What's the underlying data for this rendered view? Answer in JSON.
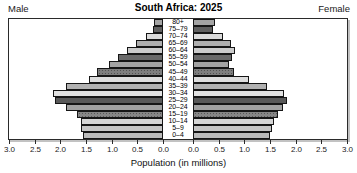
{
  "header": {
    "left_label": "Male",
    "right_label": "Female",
    "title": "South Africa: 2025"
  },
  "axis": {
    "xlabel": "Population (in millions)",
    "left_tick_labels": [
      "3.0",
      "2.5",
      "2.0",
      "1.5",
      "1.0",
      "0.5",
      "0.0"
    ],
    "right_tick_labels": [
      "0.0",
      "0.5",
      "1.0",
      "1.5",
      "2.0",
      "2.5",
      "3.0"
    ]
  },
  "chart_data": {
    "type": "bar",
    "subtype": "population-pyramid",
    "title": "South Africa: 2025",
    "xlabel": "Population (in millions)",
    "unit": "millions of people",
    "axis_range_each_side": [
      0,
      3.0
    ],
    "tick_step": 0.5,
    "grid": false,
    "categories": [
      "80+",
      "75–79",
      "70–74",
      "65–69",
      "60–64",
      "55–59",
      "50–54",
      "45–49",
      "40–44",
      "35–39",
      "30–34",
      "25–29",
      "20–24",
      "15–19",
      "10–14",
      "5–9",
      "0–4"
    ],
    "series": [
      {
        "name": "Male",
        "side": "left",
        "values": [
          0.18,
          0.19,
          0.34,
          0.52,
          0.7,
          0.87,
          1.06,
          1.29,
          1.45,
          1.89,
          2.14,
          2.1,
          1.89,
          1.67,
          1.6,
          1.6,
          1.55
        ]
      },
      {
        "name": "Female",
        "side": "right",
        "values": [
          0.42,
          0.39,
          0.58,
          0.74,
          0.81,
          0.75,
          0.7,
          0.79,
          1.1,
          1.45,
          1.78,
          1.84,
          1.75,
          1.65,
          1.58,
          1.53,
          1.5
        ]
      }
    ],
    "bar_colors": [
      "#a4a4a4",
      "#606060",
      "#dbdbdb",
      "#aeaeae",
      "#cbcbcb",
      "#696969",
      "#a4a4a4",
      "#7e7e7e",
      "#dddddd",
      "#b1b1b1",
      "#e2e2e2",
      "#595959",
      "#a1a1a1",
      "#868686",
      "#d5d5d5",
      "#c5c5c5",
      "#bbbbbb"
    ],
    "bar_patterns": [
      "solid",
      "solid",
      "solid",
      "solid",
      "solid",
      "solid",
      "solid",
      "dots",
      "solid",
      "solid",
      "solid",
      "solid",
      "solid",
      "dots",
      "solid",
      "solid",
      "solid"
    ],
    "bar_border_color": "#161616"
  }
}
